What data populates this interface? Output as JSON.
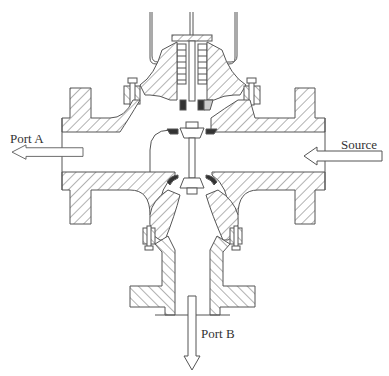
{
  "diagram": {
    "type": "three-way valve cross-section",
    "labels": {
      "port_a": "Port A",
      "source": "Source",
      "port_b": "Port B"
    },
    "arrows": [
      {
        "name": "port-a-outflow",
        "direction": "left"
      },
      {
        "name": "source-inflow",
        "direction": "left"
      },
      {
        "name": "port-b-outflow",
        "direction": "down"
      }
    ],
    "colors": {
      "line": "#555555",
      "hatch": "#666666",
      "seal": "#333333",
      "background": "#ffffff"
    }
  }
}
